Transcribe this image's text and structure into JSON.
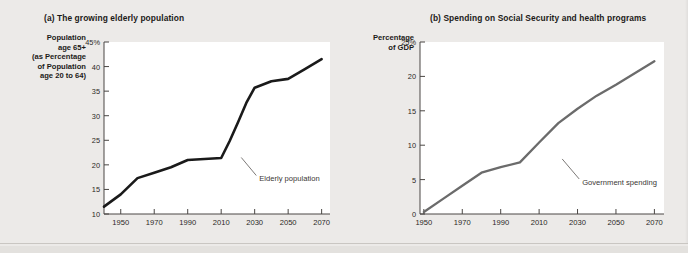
{
  "figure": {
    "background_color": "#eceae8",
    "panel_background_color": "#ffffff"
  },
  "panel_a": {
    "title": "(a) The growing elderly population",
    "y_axis_label": "Population age 65+ (as Percentage of Population age 20 to 64)",
    "y_axis_label_lines": [
      "Population",
      "age 65+",
      "(as Percentage",
      "of Population",
      "age 20 to 64)"
    ],
    "annotation": "Elderly population",
    "series_color": "#1a1a1a"
  },
  "panel_b": {
    "title": "(b) Spending on Social Security and health programs",
    "y_axis_label": "Percentage of GDP",
    "y_axis_label_lines": [
      "Percentage",
      "of GDP"
    ],
    "annotation": "Government spending",
    "series_color": "#6b6b6b"
  },
  "chart_data": [
    {
      "type": "line",
      "title": "(a) The growing elderly population",
      "xlabel": "",
      "ylabel": "Population age 65+ (as Percentage of Population age 20 to 64)",
      "xlim": [
        1940,
        2075
      ],
      "ylim": [
        10,
        45
      ],
      "xticks": [
        1950,
        1970,
        1990,
        2010,
        2030,
        2050,
        2070
      ],
      "xtick_labels": [
        "1950",
        "1970",
        "1990",
        "2010",
        "2030",
        "2050",
        "2070"
      ],
      "yticks": [
        10,
        15,
        20,
        25,
        30,
        35,
        40,
        45
      ],
      "ytick_labels": [
        "10",
        "15",
        "20",
        "25",
        "30",
        "35",
        "40",
        "45%"
      ],
      "grid": false,
      "legend": "none",
      "annotations": [
        {
          "text": "Elderly population",
          "x": 2022,
          "y": 21.5
        }
      ],
      "series": [
        {
          "name": "Elderly population",
          "color": "#1a1a1a",
          "x": [
            1940,
            1950,
            1960,
            1970,
            1980,
            1990,
            2000,
            2010,
            2015,
            2020,
            2025,
            2030,
            2040,
            2050,
            2060,
            2070
          ],
          "values": [
            11.5,
            14.0,
            17.3,
            18.4,
            19.5,
            21.0,
            21.2,
            21.4,
            24.8,
            28.6,
            32.6,
            35.7,
            37.0,
            37.5,
            39.5,
            41.5
          ]
        }
      ]
    },
    {
      "type": "line",
      "title": "(b) Spending on Social Security and health programs",
      "xlabel": "",
      "ylabel": "Percentage of GDP",
      "xlim": [
        1948,
        2075
      ],
      "ylim": [
        0,
        25
      ],
      "xticks": [
        1950,
        1970,
        1990,
        2010,
        2030,
        2050,
        2070
      ],
      "xtick_labels": [
        "1950",
        "1970",
        "1990",
        "2010",
        "2030",
        "2050",
        "2070"
      ],
      "yticks": [
        0,
        5,
        10,
        15,
        20,
        25
      ],
      "ytick_labels": [
        "0",
        "5",
        "10",
        "15",
        "20",
        "25%"
      ],
      "grid": false,
      "legend": "none",
      "annotations": [
        {
          "text": "Government spending",
          "x": 2022,
          "y": 8.0
        }
      ],
      "series": [
        {
          "name": "Government spending",
          "color": "#6b6b6b",
          "x": [
            1950,
            1960,
            1970,
            1980,
            1990,
            2000,
            2010,
            2020,
            2030,
            2040,
            2050,
            2060,
            2070
          ],
          "values": [
            0.3,
            2.2,
            4.1,
            6.0,
            6.8,
            7.5,
            10.4,
            13.2,
            15.3,
            17.2,
            18.8,
            20.5,
            22.2
          ]
        }
      ]
    }
  ]
}
